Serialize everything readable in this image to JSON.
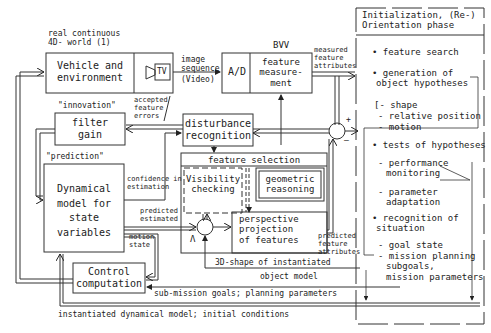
{
  "diagram": {
    "world_label": [
      "real continuous",
      "4D- world (1)"
    ],
    "vehicle_box": [
      "Vehicle and",
      "environment"
    ],
    "tv_label": "TV",
    "image_seq": [
      "image",
      "sequence",
      "(Video)"
    ],
    "ad_label": "A/D",
    "bvv_label": "BVV",
    "feature_meas": [
      "feature",
      "measure-",
      "ment"
    ],
    "measured_attrs": [
      "measured",
      "feature",
      "attributes"
    ],
    "innovation": "\"innovation\"",
    "accepted_errors": [
      "accepted",
      "feature",
      "errors"
    ],
    "filter_gain": [
      "filter",
      "gain"
    ],
    "disturbance": [
      "disturbance",
      "recognition"
    ],
    "prediction": "\"prediction\"",
    "dyn_model": [
      "Dynamical",
      "model for",
      "state",
      "variables"
    ],
    "confidence": [
      "confidence in",
      "estimation"
    ],
    "feature_selection": "feature selection",
    "visibility": [
      "Visibility",
      "checking"
    ],
    "geometric": [
      "geometric",
      "reasoning"
    ],
    "perspective": [
      "perspective",
      "projection",
      "of features"
    ],
    "predicted_estimated": [
      "predicted",
      "estimated"
    ],
    "motion_state": [
      "motion",
      "state"
    ],
    "predicted_attrs": [
      "predicted",
      "feature",
      "attributes"
    ],
    "lambda": "Λ",
    "plus": "+",
    "minus": "–",
    "shape3d": "3D-shape of instantiated",
    "object_model": "object model",
    "control": [
      "Control",
      "computation"
    ],
    "submission": "sub-mission goals; planning parameters",
    "instantiated": "instantiated dynamical model; initial conditions"
  },
  "panel": {
    "title": [
      "Initialization, (Re-)",
      "Orientation phase"
    ],
    "items": {
      "feature_search": "• feature search",
      "generation": [
        "• generation of",
        "object hypotheses"
      ],
      "shape": "[- shape",
      "relpos": "- relative position",
      "motion": "- motion",
      "tests": "• tests of hypotheses",
      "perf": [
        "- performance",
        "monitoring"
      ],
      "param": [
        "- parameter",
        "adaptation"
      ],
      "recognition": [
        "• recognition of",
        "situation"
      ],
      "goal": "- goal state",
      "mission": [
        "- mission planning",
        "subgoals,",
        "mission parameters"
      ]
    }
  }
}
